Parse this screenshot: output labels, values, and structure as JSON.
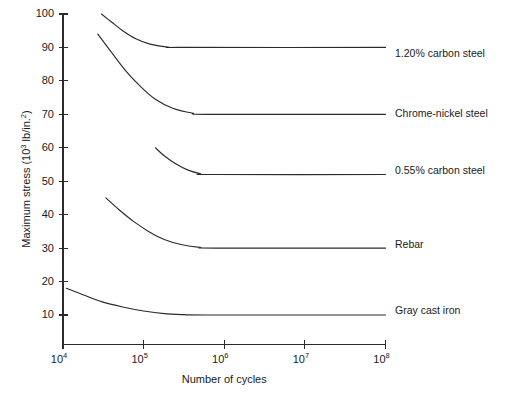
{
  "chart_data": {
    "type": "line",
    "title": "",
    "xlabel": "Number of cycles",
    "ylabel": "Maximum stress (10³ lb/in.²)",
    "ylabel_parts": {
      "prefix": "Maximum stress (10",
      "sup1": "3",
      "mid": " lb/in.",
      "sup2": "2",
      "suffix": ")"
    },
    "x_scale": "log",
    "y_scale": "linear",
    "xlim": [
      10000,
      100000000
    ],
    "ylim": [
      0,
      100
    ],
    "grid": false,
    "legend_position": "right-inline",
    "x_ticks": [
      {
        "value": 10000,
        "mantissa": "10",
        "exponent": "4"
      },
      {
        "value": 100000,
        "mantissa": "10",
        "exponent": "5"
      },
      {
        "value": 1000000,
        "mantissa": "10",
        "exponent": "6"
      },
      {
        "value": 10000000,
        "mantissa": "10",
        "exponent": "7"
      },
      {
        "value": 100000000,
        "mantissa": "10",
        "exponent": "8"
      }
    ],
    "y_ticks": [
      10,
      20,
      30,
      40,
      50,
      60,
      70,
      80,
      90,
      100
    ],
    "series": [
      {
        "name": "1.20% carbon steel",
        "endurance_limit": 90,
        "label_y_value": 88,
        "points": [
          [
            30000,
            100
          ],
          [
            40000,
            97.6
          ],
          [
            55000,
            95.0
          ],
          [
            80000,
            92.6
          ],
          [
            120000,
            91.0
          ],
          [
            200000,
            90.1
          ],
          [
            350000,
            90.0
          ],
          [
            100000000,
            90.0
          ]
        ]
      },
      {
        "name": "Chrome-nickel steel",
        "endurance_limit": 70,
        "label_y_value": 70,
        "points": [
          [
            27000,
            94
          ],
          [
            40000,
            88.5
          ],
          [
            60000,
            83.0
          ],
          [
            90000,
            78.5
          ],
          [
            140000,
            74.5
          ],
          [
            230000,
            71.8
          ],
          [
            400000,
            70.4
          ],
          [
            700000,
            70.0
          ],
          [
            100000000,
            70.0
          ]
        ]
      },
      {
        "name": "0.55% carbon steel",
        "endurance_limit": 52,
        "label_y_value": 53,
        "points": [
          [
            140000,
            60
          ],
          [
            180000,
            57.6
          ],
          [
            250000,
            55.2
          ],
          [
            350000,
            53.4
          ],
          [
            500000,
            52.3
          ],
          [
            750000,
            52.0
          ],
          [
            100000000,
            52.0
          ]
        ]
      },
      {
        "name": "Rebar",
        "endurance_limit": 30,
        "label_y_value": 31,
        "points": [
          [
            34000,
            45
          ],
          [
            50000,
            41.4
          ],
          [
            75000,
            38.0
          ],
          [
            115000,
            35.0
          ],
          [
            180000,
            32.6
          ],
          [
            300000,
            31.0
          ],
          [
            500000,
            30.2
          ],
          [
            800000,
            30.0
          ],
          [
            100000000,
            30.0
          ]
        ]
      },
      {
        "name": "Gray cast iron",
        "endurance_limit": 10,
        "label_y_value": 11,
        "points": [
          [
            11000,
            18
          ],
          [
            18000,
            16.0
          ],
          [
            30000,
            14.0
          ],
          [
            55000,
            12.4
          ],
          [
            100000,
            11.2
          ],
          [
            180000,
            10.4
          ],
          [
            320000,
            10.1
          ],
          [
            600000,
            10.0
          ],
          [
            100000000,
            10.0
          ]
        ]
      }
    ],
    "colors": {
      "curve": "#2b2b2b",
      "axis": "#2b2b2b",
      "text": "#1a1a1a",
      "background": "#ffffff"
    }
  }
}
